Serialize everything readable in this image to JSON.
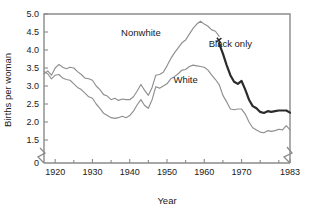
{
  "chart_data": {
    "type": "line",
    "title": "",
    "xlabel": "Year",
    "ylabel": "Births per woman",
    "xlim": [
      1917,
      1983
    ],
    "ylim": [
      1.2,
      5.0
    ],
    "grid": false,
    "legend_position": "inline-annotations",
    "xticks": [
      1920,
      1930,
      1940,
      1950,
      1960,
      1970,
      1983
    ],
    "xticklabels": [
      "1920",
      "1930",
      "1940",
      "1950",
      "1960",
      "1970",
      "1983"
    ],
    "xminorticks": [
      1925,
      1935,
      1945,
      1955,
      1965,
      1975,
      1980
    ],
    "yticks": [
      0,
      1.5,
      2.0,
      2.5,
      3.0,
      3.5,
      4.0,
      4.5,
      5.0
    ],
    "yticklabels": [
      "0",
      "1.5",
      "2.0",
      "2.5",
      "3.0",
      "3.5",
      "4.0",
      "4.5",
      "5.0"
    ],
    "axis_break_y": true,
    "axis_break_x_right": true,
    "annotations": [
      {
        "text": "Nonwhite",
        "x": 1943,
        "y": 4.38
      },
      {
        "text": "Black only",
        "x": 1967,
        "y": 4.08
      },
      {
        "text": "White",
        "x": 1955,
        "y": 3.08
      }
    ],
    "series": [
      {
        "name": "Nonwhite",
        "color": "#8f8f8f",
        "style": "thin",
        "x": [
          1917,
          1918,
          1919,
          1920,
          1921,
          1922,
          1923,
          1924,
          1925,
          1926,
          1927,
          1928,
          1929,
          1930,
          1931,
          1932,
          1933,
          1934,
          1935,
          1936,
          1937,
          1938,
          1939,
          1940,
          1941,
          1942,
          1943,
          1944,
          1945,
          1946,
          1947,
          1948,
          1949,
          1950,
          1951,
          1952,
          1953,
          1954,
          1955,
          1956,
          1957,
          1958,
          1959,
          1960,
          1961,
          1962,
          1963,
          1964
        ],
        "y": [
          3.33,
          3.42,
          3.3,
          3.5,
          3.6,
          3.52,
          3.48,
          3.52,
          3.5,
          3.4,
          3.32,
          3.22,
          3.2,
          3.16,
          3.0,
          2.9,
          2.76,
          2.72,
          2.62,
          2.66,
          2.6,
          2.64,
          2.62,
          2.62,
          2.7,
          2.86,
          3.04,
          2.88,
          2.74,
          2.96,
          3.3,
          3.32,
          3.38,
          3.56,
          3.76,
          3.92,
          4.06,
          4.2,
          4.28,
          4.44,
          4.6,
          4.72,
          4.8,
          4.72,
          4.66,
          4.56,
          4.52,
          4.38
        ]
      },
      {
        "name": "Black only",
        "color": "#2b2b2b",
        "style": "thick",
        "x": [
          1964,
          1965,
          1966,
          1967,
          1968,
          1969,
          1970,
          1971,
          1972,
          1973,
          1974,
          1975,
          1976,
          1977,
          1978,
          1979,
          1980,
          1981,
          1982,
          1983
        ],
        "y": [
          4.18,
          3.9,
          3.58,
          3.3,
          3.12,
          3.06,
          3.14,
          2.9,
          2.62,
          2.44,
          2.38,
          2.28,
          2.25,
          2.3,
          2.28,
          2.3,
          2.32,
          2.32,
          2.32,
          2.26
        ]
      },
      {
        "name": "White",
        "color": "#8f8f8f",
        "style": "thin",
        "x": [
          1917,
          1918,
          1919,
          1920,
          1921,
          1922,
          1923,
          1924,
          1925,
          1926,
          1927,
          1928,
          1929,
          1930,
          1931,
          1932,
          1933,
          1934,
          1935,
          1936,
          1937,
          1938,
          1939,
          1940,
          1941,
          1942,
          1943,
          1944,
          1945,
          1946,
          1947,
          1948,
          1949,
          1950,
          1951,
          1952,
          1953,
          1954,
          1955,
          1956,
          1957,
          1958,
          1959,
          1960,
          1961,
          1962,
          1963,
          1964,
          1965,
          1966,
          1967,
          1968,
          1969,
          1970,
          1971,
          1972,
          1973,
          1974,
          1975,
          1976,
          1977,
          1978,
          1979,
          1980,
          1981,
          1982,
          1983
        ],
        "y": [
          3.4,
          3.34,
          3.2,
          3.3,
          3.32,
          3.22,
          3.18,
          3.16,
          3.06,
          2.96,
          2.9,
          2.8,
          2.7,
          2.66,
          2.5,
          2.38,
          2.24,
          2.18,
          2.12,
          2.1,
          2.12,
          2.16,
          2.12,
          2.18,
          2.3,
          2.48,
          2.62,
          2.46,
          2.38,
          2.62,
          2.98,
          2.94,
          3.0,
          3.06,
          3.2,
          3.26,
          3.34,
          3.44,
          3.46,
          3.54,
          3.58,
          3.56,
          3.54,
          3.52,
          3.44,
          3.3,
          3.18,
          3.04,
          2.74,
          2.56,
          2.36,
          2.34,
          2.36,
          2.36,
          2.22,
          2.0,
          1.84,
          1.78,
          1.72,
          1.7,
          1.76,
          1.74,
          1.76,
          1.8,
          1.78,
          1.9,
          1.78
        ]
      }
    ]
  }
}
